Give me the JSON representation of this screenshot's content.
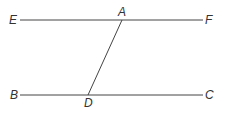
{
  "diagram": {
    "colors": {
      "line": "#444444",
      "label": "#333333",
      "background": "#ffffff"
    },
    "points": {
      "E": {
        "label": "E",
        "x": 13,
        "y": 24
      },
      "A": {
        "label": "A",
        "x": 122,
        "y": 17
      },
      "F": {
        "label": "F",
        "x": 209,
        "y": 24
      },
      "B": {
        "label": "B",
        "x": 14,
        "y": 99
      },
      "D": {
        "label": "D",
        "x": 88,
        "y": 107
      },
      "C": {
        "label": "C",
        "x": 209,
        "y": 99
      }
    },
    "segments": [
      {
        "name": "line-EF",
        "from": "E",
        "to": "F"
      },
      {
        "name": "line-BC",
        "from": "B",
        "to": "C"
      },
      {
        "name": "line-AD",
        "from": "A",
        "to": "D"
      }
    ]
  }
}
